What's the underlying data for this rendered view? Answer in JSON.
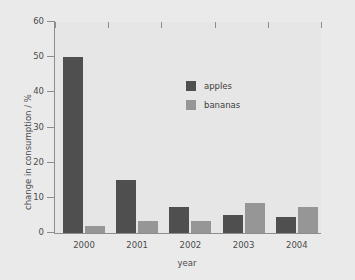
{
  "chart_data": {
    "type": "bar",
    "title": "",
    "xlabel": "year",
    "ylabel": "change in consumption / %",
    "categories": [
      "2000",
      "2001",
      "2002",
      "2003",
      "2004"
    ],
    "series": [
      {
        "name": "apples",
        "color": "#4f4f4f",
        "values": [
          50,
          15,
          7.5,
          5,
          4.5
        ]
      },
      {
        "name": "bananas",
        "color": "#969696",
        "values": [
          2,
          3.5,
          3.5,
          8.5,
          7.5
        ]
      }
    ],
    "ylim": [
      0,
      60
    ],
    "yticks": [
      0,
      10,
      20,
      30,
      40,
      50,
      60
    ],
    "ytick_labels": [
      "0",
      "10",
      "20",
      "30",
      "40",
      "50",
      "60"
    ],
    "grid": false,
    "legend_position": "upper-center",
    "background_color": "#e9e9e9",
    "axis_color": "#8d8d8d"
  },
  "legend": {
    "entries": [
      {
        "label": "apples"
      },
      {
        "label": "bananas"
      }
    ]
  }
}
